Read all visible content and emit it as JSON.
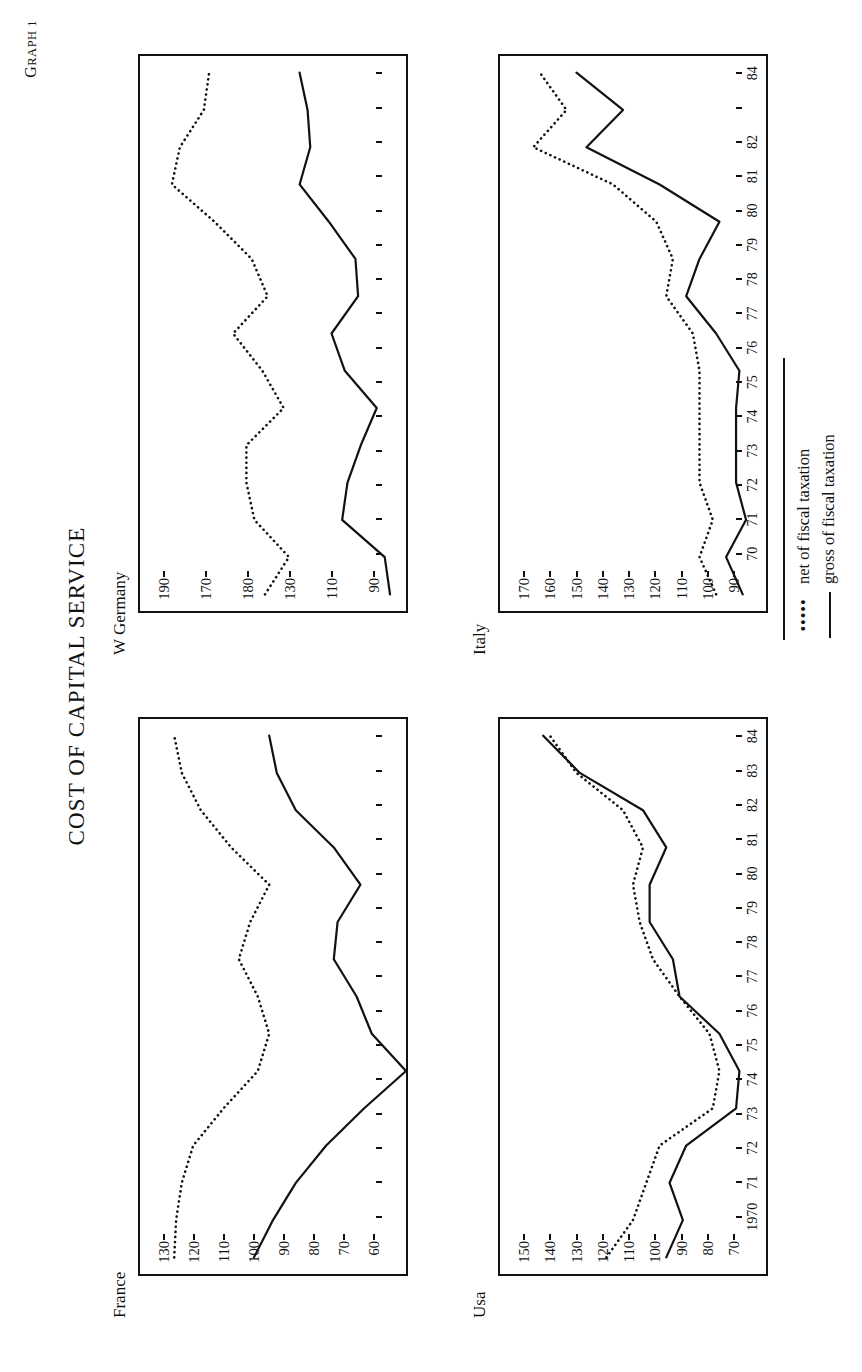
{
  "page": {
    "graph_number_prefix": "G",
    "graph_number": "RAPH 1",
    "title": "COST OF CAPITAL SERVICE"
  },
  "legend": {
    "net_key": "•••••",
    "net_label": "net of fiscal taxation",
    "gross_key": "",
    "gross_label": "gross of fiscal taxation"
  },
  "chart_data": [
    {
      "type": "line",
      "title": "France",
      "xlabel": "",
      "ylabel": "",
      "grid": false,
      "legend_position": "bottom-right (shared)",
      "ylim": [
        60,
        130
      ],
      "yticks": [
        130,
        120,
        110,
        100,
        90,
        80,
        70,
        60
      ],
      "x": [
        1970,
        1971,
        1972,
        1973,
        1974,
        1975,
        1976,
        1977,
        1978,
        1979,
        1980,
        1981,
        1982,
        1983,
        1984
      ],
      "xticklabels": [
        "1970",
        "71",
        "72",
        "73",
        "74",
        "75",
        "76",
        "77",
        "78",
        "79",
        "80",
        "81",
        "82",
        "83",
        "84"
      ],
      "series": [
        {
          "name": "net of fiscal taxation",
          "style": "dotted",
          "values": [
            121,
            120.5,
            119,
            116,
            108,
            99,
            96,
            99,
            104,
            101,
            96,
            106,
            114,
            119,
            121
          ]
        },
        {
          "name": "gross of fiscal taxation",
          "style": "solid",
          "values": [
            100,
            95,
            89,
            81,
            71,
            60,
            69,
            73,
            79,
            78,
            72,
            79,
            89,
            94,
            96
          ]
        }
      ]
    },
    {
      "type": "line",
      "title": "W Germany",
      "xlabel": "",
      "ylabel": "",
      "grid": false,
      "legend_position": "bottom-right (shared)",
      "ylim": [
        90,
        190
      ],
      "yticks": [
        190,
        170,
        180,
        130,
        110,
        90
      ],
      "ytick_positions": [
        190,
        170,
        150,
        130,
        110,
        90
      ],
      "x": [
        1970,
        1971,
        1972,
        1973,
        1974,
        1975,
        1976,
        1977,
        1978,
        1979,
        1980,
        1981,
        1982,
        1983,
        1984
      ],
      "xticklabels": [
        "1970",
        "71",
        "72",
        "73",
        "74",
        "75",
        "76",
        "77",
        "78",
        "79",
        "80",
        "81",
        "82",
        "83",
        "84"
      ],
      "series": [
        {
          "name": "net of fiscal taxation",
          "style": "dotted",
          "values": [
            143,
            134,
            147,
            150,
            150,
            136,
            144,
            155,
            142,
            148,
            162,
            178,
            175,
            166,
            164
          ]
        },
        {
          "name": "gross of fiscal taxation",
          "style": "solid",
          "values": [
            96,
            98,
            114,
            112,
            107,
            101,
            113,
            118,
            108,
            109,
            119,
            130,
            126,
            127,
            130
          ]
        }
      ]
    },
    {
      "type": "line",
      "title": "Usa",
      "xlabel": "",
      "ylabel": "",
      "grid": false,
      "legend_position": "bottom-right (shared)",
      "ylim": [
        70,
        150
      ],
      "yticks": [
        150,
        140,
        130,
        120,
        110,
        100,
        90,
        80,
        70
      ],
      "x": [
        1970,
        1971,
        1972,
        1973,
        1974,
        1975,
        1976,
        1977,
        1978,
        1979,
        1980,
        1981,
        1982,
        1983,
        1984
      ],
      "xticklabels": [
        "1970",
        "71",
        "72",
        "73",
        "74",
        "75",
        "76",
        "77",
        "78",
        "79",
        "80",
        "81",
        "82",
        "83",
        "84"
      ],
      "series": [
        {
          "name": "net of fiscal taxation",
          "style": "dotted",
          "values": [
            118,
            110,
            106,
            102,
            86,
            84,
            87,
            96,
            104,
            108,
            110,
            107,
            113,
            127,
            135
          ]
        },
        {
          "name": "gross of fiscal taxation",
          "style": "solid",
          "values": [
            100,
            95,
            99,
            94,
            79,
            78,
            84,
            96,
            98,
            105,
            105,
            100,
            107,
            126,
            137
          ]
        }
      ]
    },
    {
      "type": "line",
      "title": "Italy",
      "xlabel": "",
      "ylabel": "",
      "grid": false,
      "legend_position": "bottom-right (shared)",
      "ylim": [
        90,
        170
      ],
      "yticks": [
        170,
        160,
        150,
        140,
        130,
        120,
        110,
        100,
        90
      ],
      "x": [
        1970,
        1971,
        1972,
        1973,
        1974,
        1975,
        1976,
        1977,
        1978,
        1979,
        1980,
        1981,
        1982,
        1983,
        1984
      ],
      "xticklabels": [
        "70",
        "71",
        "72",
        "73",
        "74",
        "75",
        "76",
        "77",
        "78",
        "79",
        "80",
        "81",
        "82",
        "",
        "84"
      ],
      "series": [
        {
          "name": "net of fiscal taxation",
          "style": "dotted",
          "values": [
            105,
            110,
            106,
            110,
            110,
            110,
            110,
            112,
            120,
            118,
            123,
            136,
            160,
            150,
            158
          ]
        },
        {
          "name": "gross of fiscal taxation",
          "style": "solid",
          "values": [
            97,
            102,
            96,
            99,
            99,
            99,
            98,
            105,
            114,
            110,
            104,
            122,
            144,
            133,
            147
          ]
        }
      ]
    }
  ]
}
